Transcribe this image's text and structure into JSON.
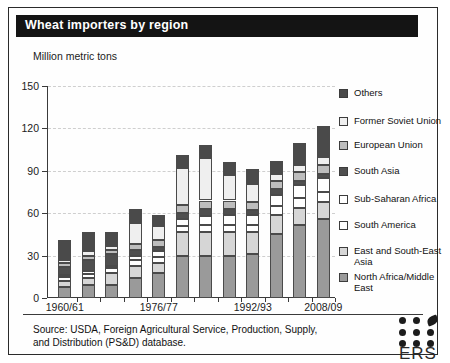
{
  "header": {
    "title": "Wheat importers by region"
  },
  "footer": {
    "source": "Source: USDA, Foreign Agricultural Service, Production, Supply, and Distribution (PS&D) database.",
    "logo_text": "ERS",
    "logo_icon": "ers-leaf-dots-logo"
  },
  "chart_data": {
    "type": "bar",
    "stacked": true,
    "title": "Wheat importers by region",
    "xlabel": "",
    "ylabel": "Million metric tons",
    "ylim": [
      0,
      150
    ],
    "yticks": [
      0,
      30,
      60,
      90,
      120,
      150
    ],
    "grid": true,
    "legend_position": "right",
    "categories": [
      "1960/61",
      "1964/65",
      "1968/69",
      "1972/73",
      "1976/77",
      "1980/81",
      "1984/85",
      "1988/89",
      "1992/93",
      "1996/97",
      "2000/01",
      "2008/09"
    ],
    "tick_labels": [
      "1960/61",
      "1976/77",
      "1992/93",
      "2008/09"
    ],
    "tick_label_indices": [
      0,
      4,
      8,
      11
    ],
    "series": [
      {
        "name": "North Africa/Middle East",
        "color": "#9a9a9a",
        "values": [
          8,
          9,
          9,
          14,
          18,
          30,
          30,
          30,
          31,
          45,
          52,
          56
        ]
      },
      {
        "name": "East and South-East Asia",
        "color": "#d6d6d6",
        "values": [
          4,
          5,
          9,
          9,
          7,
          17,
          17,
          17,
          16,
          14,
          12,
          12
        ]
      },
      {
        "name": "South America",
        "color": "#ffffff",
        "values": [
          3,
          3,
          3,
          4,
          4,
          4,
          5,
          5,
          5,
          6,
          7,
          7
        ]
      },
      {
        "name": "Sub-Saharan Africa",
        "color": "#ffffff",
        "values": [
          1,
          2,
          2,
          3,
          4,
          5,
          6,
          7,
          7,
          8,
          9,
          10
        ]
      },
      {
        "name": "South Asia",
        "color": "#4f4f4f",
        "values": [
          6,
          8,
          8,
          4,
          3,
          4,
          5,
          4,
          3,
          4,
          3,
          3
        ]
      },
      {
        "name": "European Union",
        "color": "#bdbdbd",
        "values": [
          3,
          3,
          3,
          4,
          5,
          6,
          6,
          6,
          6,
          6,
          6,
          6
        ]
      },
      {
        "name": "Former Soviet Union",
        "color": "#efefef",
        "values": [
          2,
          3,
          3,
          15,
          10,
          26,
          30,
          18,
          13,
          5,
          5,
          6
        ]
      },
      {
        "name": "Others",
        "color": "#4a4a4a",
        "values": [
          14,
          14,
          10,
          10,
          8,
          9,
          9,
          9,
          10,
          9,
          16,
          22
        ]
      }
    ],
    "legend_order": [
      "Others",
      "Former Soviet Union",
      "European Union",
      "South Asia",
      "Sub-Saharan Africa",
      "South America",
      "East and South-East Asia",
      "North Africa/Middle East"
    ]
  }
}
